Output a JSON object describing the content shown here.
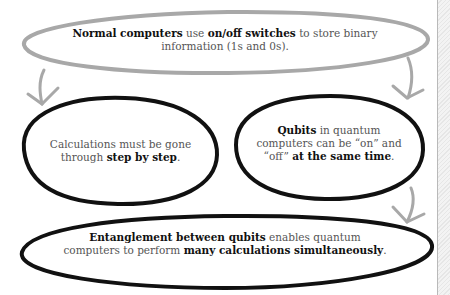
{
  "diagram": {
    "nodes": [
      {
        "id": "normal-computers",
        "style": "gray-outline",
        "segments": [
          {
            "text": "Normal computers",
            "bold": true
          },
          {
            "text": " use ",
            "bold": false
          },
          {
            "text": "on/off switches",
            "bold": true
          },
          {
            "text": " to store binary information (1s and 0s).",
            "bold": false
          }
        ]
      },
      {
        "id": "step-by-step",
        "style": "black-outline",
        "segments": [
          {
            "text": "Calculations must be gone through ",
            "bold": false
          },
          {
            "text": "step by step",
            "bold": true
          },
          {
            "text": ".",
            "bold": false
          }
        ]
      },
      {
        "id": "qubits",
        "style": "black-outline",
        "segments": [
          {
            "text": "Qubits",
            "bold": true
          },
          {
            "text": " in quantum computers can be “on” and “off” ",
            "bold": false
          },
          {
            "text": "at the same time",
            "bold": true
          },
          {
            "text": ".",
            "bold": false
          }
        ]
      },
      {
        "id": "entanglement",
        "style": "black-outline",
        "segments": [
          {
            "text": "Entanglement between qubits",
            "bold": true
          },
          {
            "text": " enables quantum computers to perform ",
            "bold": false
          },
          {
            "text": "many calculations simultaneously",
            "bold": true
          },
          {
            "text": ".",
            "bold": false
          }
        ]
      }
    ],
    "edges": [
      {
        "from": "normal-computers",
        "to": "step-by-step"
      },
      {
        "from": "normal-computers",
        "to": "qubits"
      },
      {
        "from": "qubits",
        "to": "entanglement"
      }
    ],
    "colors": {
      "gray_outline": "#a8a8a8",
      "black_outline": "#111111",
      "arrow": "#a8a8a8",
      "text_regular": "#555555",
      "text_bold": "#111111"
    }
  }
}
